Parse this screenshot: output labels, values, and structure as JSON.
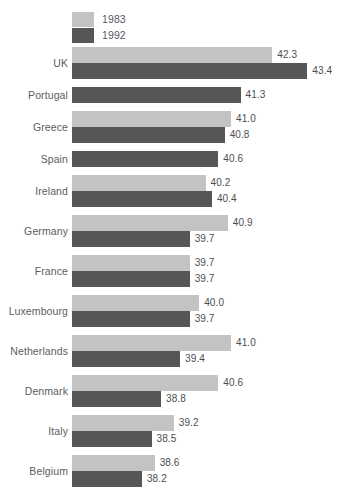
{
  "title_remnant": "",
  "legend": {
    "position": "top-left",
    "items": [
      {
        "label": "1983",
        "color": "#c3c3c3",
        "icon": "legend-swatch-icon"
      },
      {
        "label": "1992",
        "color": "#565656",
        "icon": "legend-swatch-icon"
      }
    ]
  },
  "chart_data": {
    "type": "bar",
    "orientation": "horizontal",
    "title": "",
    "subtitle": "",
    "xlabel": "",
    "ylabel": "",
    "grid": false,
    "legend_position": "top-left",
    "value_labels": true,
    "xlim": [
      36.0,
      44.0
    ],
    "categories": [
      "UK",
      "Portugal",
      "Greece",
      "Spain",
      "Ireland",
      "Germany",
      "France",
      "Luxembourg",
      "Netherlands",
      "Denmark",
      "Italy",
      "Belgium"
    ],
    "series": [
      {
        "name": "1983",
        "color": "#c3c3c3",
        "values": [
          42.3,
          null,
          41.0,
          null,
          40.2,
          40.9,
          39.7,
          40.0,
          41.0,
          40.6,
          39.2,
          38.6
        ]
      },
      {
        "name": "1992",
        "color": "#565656",
        "values": [
          43.4,
          41.3,
          40.8,
          40.6,
          40.4,
          39.7,
          39.7,
          39.7,
          39.4,
          38.8,
          38.5,
          38.2
        ]
      }
    ]
  },
  "rows": [
    {
      "label": "UK",
      "bars": [
        {
          "series": "1983",
          "value": 42.3,
          "text": "42.3"
        },
        {
          "series": "1992",
          "value": 43.4,
          "text": "43.4"
        }
      ]
    },
    {
      "label": "Portugal",
      "bars": [
        {
          "series": "1992",
          "value": 41.3,
          "text": "41.3"
        }
      ]
    },
    {
      "label": "Greece",
      "bars": [
        {
          "series": "1983",
          "value": 41.0,
          "text": "41.0"
        },
        {
          "series": "1992",
          "value": 40.8,
          "text": "40.8"
        }
      ]
    },
    {
      "label": "Spain",
      "bars": [
        {
          "series": "1992",
          "value": 40.6,
          "text": "40.6"
        }
      ]
    },
    {
      "label": "Ireland",
      "bars": [
        {
          "series": "1983",
          "value": 40.2,
          "text": "40.2"
        },
        {
          "series": "1992",
          "value": 40.4,
          "text": "40.4"
        }
      ]
    },
    {
      "label": "Germany",
      "bars": [
        {
          "series": "1983",
          "value": 40.9,
          "text": "40.9"
        },
        {
          "series": "1992",
          "value": 39.7,
          "text": "39.7"
        }
      ]
    },
    {
      "label": "France",
      "bars": [
        {
          "series": "1983",
          "value": 39.7,
          "text": "39.7"
        },
        {
          "series": "1992",
          "value": 39.7,
          "text": "39.7"
        }
      ]
    },
    {
      "label": "Luxembourg",
      "bars": [
        {
          "series": "1983",
          "value": 40.0,
          "text": "40.0"
        },
        {
          "series": "1992",
          "value": 39.7,
          "text": "39.7"
        }
      ]
    },
    {
      "label": "Netherlands",
      "bars": [
        {
          "series": "1983",
          "value": 41.0,
          "text": "41.0"
        },
        {
          "series": "1992",
          "value": 39.4,
          "text": "39.4"
        }
      ]
    },
    {
      "label": "Denmark",
      "bars": [
        {
          "series": "1983",
          "value": 40.6,
          "text": "40.6"
        },
        {
          "series": "1992",
          "value": 38.8,
          "text": "38.8"
        }
      ]
    },
    {
      "label": "Italy",
      "bars": [
        {
          "series": "1983",
          "value": 39.2,
          "text": "39.2"
        },
        {
          "series": "1992",
          "value": 38.5,
          "text": "38.5"
        }
      ]
    },
    {
      "label": "Belgium",
      "bars": [
        {
          "series": "1983",
          "value": 38.6,
          "text": "38.6"
        },
        {
          "series": "1992",
          "value": 38.2,
          "text": "38.2"
        }
      ]
    }
  ]
}
